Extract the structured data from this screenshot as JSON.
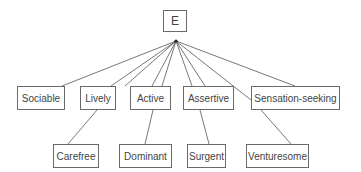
{
  "diagram": {
    "root": {
      "label": "E",
      "x": 163,
      "y": 10,
      "w": 24,
      "h": 22
    },
    "apex": {
      "x": 176,
      "y": 41
    },
    "line_color": "#555555",
    "level1": [
      {
        "label": "Sociable",
        "x": 17,
        "y": 86,
        "w": 48,
        "h": 24
      },
      {
        "label": "Lively",
        "x": 80,
        "y": 86,
        "w": 36,
        "h": 24
      },
      {
        "label": "Active",
        "x": 130,
        "y": 86,
        "w": 41,
        "h": 24
      },
      {
        "label": "Assertive",
        "x": 183,
        "y": 86,
        "w": 51,
        "h": 24
      },
      {
        "label": "Sensation-seeking",
        "x": 251,
        "y": 86,
        "w": 89,
        "h": 24
      }
    ],
    "level2": [
      {
        "label": "Carefree",
        "x": 53,
        "y": 144,
        "w": 46,
        "h": 24
      },
      {
        "label": "Dominant",
        "x": 119,
        "y": 144,
        "w": 53,
        "h": 24
      },
      {
        "label": "Surgent",
        "x": 187,
        "y": 144,
        "w": 39,
        "h": 24
      },
      {
        "label": "Venturesome",
        "x": 246,
        "y": 144,
        "w": 63,
        "h": 24
      }
    ],
    "fan_lines": [
      {
        "x2": 62,
        "y2": 86
      },
      {
        "x2": 111,
        "y2": 86
      },
      {
        "x2": 125,
        "y2": 86
      },
      {
        "x2": 152,
        "y2": 86
      },
      {
        "x2": 162,
        "y2": 86
      },
      {
        "x2": 192,
        "y2": 86
      },
      {
        "x2": 205,
        "y2": 86
      },
      {
        "x2": 251,
        "y2": 100
      },
      {
        "x2": 295,
        "y2": 86
      }
    ],
    "sub_lines": [
      {
        "x1": 97,
        "y1": 110,
        "x2": 68,
        "y2": 144
      },
      {
        "x1": 153,
        "y1": 110,
        "x2": 145,
        "y2": 144
      },
      {
        "x1": 200,
        "y1": 110,
        "x2": 209,
        "y2": 144
      },
      {
        "x1": 261,
        "y1": 110,
        "x2": 291,
        "y2": 144
      }
    ]
  }
}
